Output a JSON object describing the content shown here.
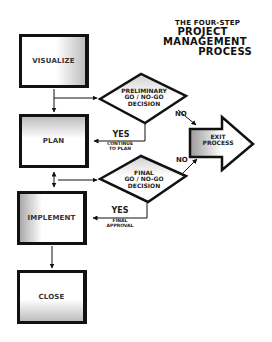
{
  "title": {
    "line1": "THE FOUR-STEP",
    "line2": "PROJECT",
    "line3": "MANAGEMENT",
    "line4": "PROCESS"
  },
  "steps": [
    {
      "id": "visualize",
      "label": "VISUALIZE"
    },
    {
      "id": "plan",
      "label": "PLAN"
    },
    {
      "id": "implement",
      "label": "IMPLEMENT"
    },
    {
      "id": "close",
      "label": "CLOSE"
    }
  ],
  "decisions": [
    {
      "id": "preliminary",
      "line1": "PRELIMINARY",
      "line2": "GO / NO-GO",
      "line3": "DECISION",
      "yes_label": "YES",
      "yes_note_line1": "CONTINUE",
      "yes_note_line2": "TO PLAN",
      "no_label": "NO"
    },
    {
      "id": "final",
      "line1": "FINAL",
      "line2": "GO / NO-GO",
      "line3": "DECISION",
      "yes_label": "YES",
      "yes_note_line1": "FINAL",
      "yes_note_line2": "APPROVAL",
      "no_label": "NO"
    }
  ],
  "exit": {
    "line1": "EXIT",
    "line2": "PROCESS"
  },
  "colors": {
    "stroke": "#111111",
    "text": "#333333",
    "shade": "#bdbdbd",
    "background": "#ffffff"
  }
}
